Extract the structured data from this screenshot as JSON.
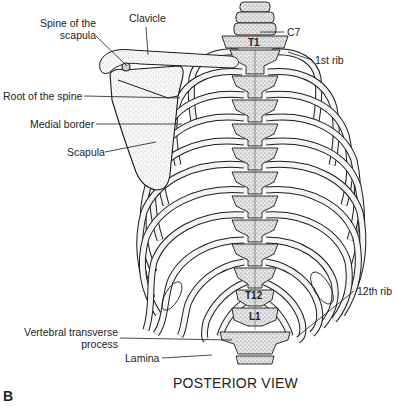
{
  "figure": {
    "panel_letter": "B",
    "view_title": "POSTERIOR VIEW",
    "colors": {
      "line": "#1a1a1a",
      "bone_fill": "#f4f4f4",
      "stipple": "#8a8a8a",
      "background": "#ffffff"
    }
  },
  "labels": {
    "spine_of_scapula": {
      "line1": "Spine of the",
      "line2": "scapula"
    },
    "clavicle": "Clavicle",
    "c7": "C7",
    "first_rib": "1st rib",
    "root_of_spine": "Root of the spine",
    "medial_border": "Medial border",
    "scapula": "Scapula",
    "twelfth_rib": "12th rib",
    "vertebral_transverse_process": {
      "line1": "Vertebral transverse",
      "line2": "process"
    },
    "lamina": "Lamina"
  },
  "vertebra_labels": {
    "t1": "T1",
    "t12": "T12",
    "l1": "L1"
  }
}
